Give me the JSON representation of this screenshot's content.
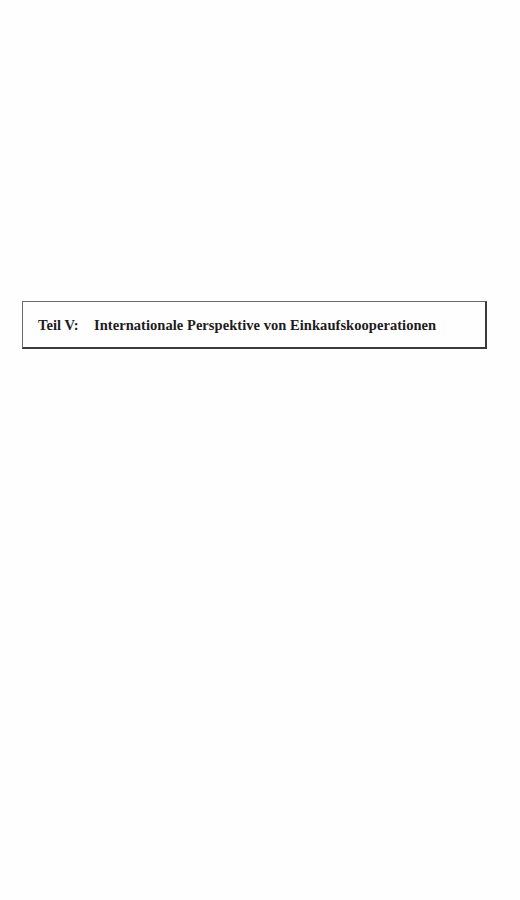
{
  "document": {
    "part_heading": {
      "label": "Teil V:",
      "title": "Internationale Perspektive von Einkaufskooperationen"
    }
  }
}
